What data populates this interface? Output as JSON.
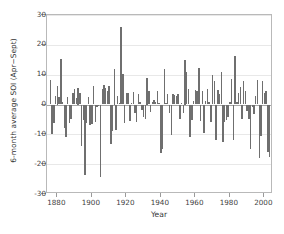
{
  "chart_data": {
    "type": "bar",
    "title": "",
    "subtitle": "",
    "xlabel": "Year",
    "ylabel": "6-month average SOI (Apr−Sept)",
    "xlim": [
      1874,
      2005
    ],
    "ylim": [
      -30,
      30
    ],
    "xticks": [
      1880,
      1900,
      1920,
      1940,
      1960,
      1980,
      2000
    ],
    "xtick_labels": [
      "1880",
      "1900",
      "1920",
      "1940",
      "1960",
      "1980",
      "2000"
    ],
    "yticks": [
      30,
      20,
      10,
      0,
      -10,
      -20,
      -30
    ],
    "ytick_labels": [
      "30",
      "20",
      "10",
      "0",
      "-10",
      "-20",
      "-30"
    ],
    "grid": true,
    "grid_axis": "y",
    "legend": "none",
    "bar_color": "#6f6f6f",
    "zero_line_color": "#a8a8a8",
    "frame_color": "#b9b9b9",
    "categories": [
      1876,
      1877,
      1878,
      1879,
      1880,
      1881,
      1882,
      1883,
      1884,
      1885,
      1886,
      1887,
      1888,
      1889,
      1890,
      1891,
      1892,
      1893,
      1894,
      1895,
      1896,
      1897,
      1898,
      1899,
      1900,
      1901,
      1902,
      1903,
      1904,
      1905,
      1906,
      1907,
      1908,
      1909,
      1910,
      1911,
      1912,
      1913,
      1914,
      1915,
      1916,
      1917,
      1918,
      1919,
      1920,
      1921,
      1922,
      1923,
      1924,
      1925,
      1926,
      1927,
      1928,
      1929,
      1930,
      1931,
      1932,
      1933,
      1934,
      1935,
      1936,
      1937,
      1938,
      1939,
      1940,
      1941,
      1942,
      1943,
      1944,
      1945,
      1946,
      1947,
      1948,
      1949,
      1950,
      1951,
      1952,
      1953,
      1954,
      1955,
      1956,
      1957,
      1958,
      1959,
      1960,
      1961,
      1962,
      1963,
      1964,
      1965,
      1966,
      1967,
      1968,
      1969,
      1970,
      1971,
      1972,
      1973,
      1974,
      1975,
      1976,
      1977,
      1978,
      1979,
      1980,
      1981,
      1982,
      1983,
      1984,
      1985,
      1986,
      1987,
      1988,
      1989,
      1990,
      1991,
      1992,
      1993,
      1994,
      1995,
      1996,
      1997,
      1998,
      1999,
      2000,
      2001,
      2002,
      2003
    ],
    "values": [
      8.1,
      -9.9,
      -6.3,
      3.0,
      6.2,
      2.5,
      15.3,
      1.0,
      -8.0,
      -10.9,
      2.4,
      -6.1,
      -4.9,
      3.9,
      5.2,
      2.2,
      5.7,
      4.0,
      -13.8,
      -5.2,
      -23.5,
      -6.3,
      2.6,
      -7.0,
      -6.7,
      6.1,
      -6.0,
      -1.0,
      -0.4,
      -24.2,
      5.1,
      6.4,
      5.6,
      4.5,
      6.3,
      -13.3,
      -8.9,
      11.9,
      -8.6,
      3.0,
      0.5,
      26.0,
      10.2,
      -6.3,
      4.0,
      3.8,
      -5.5,
      0.5,
      4.2,
      -3.0,
      -5.8,
      3.5,
      1.0,
      -2.0,
      -4.2,
      -4.7,
      8.8,
      4.6,
      -2.5,
      0.8,
      1.5,
      0.9,
      4.6,
      0.5,
      -16.2,
      -14.8,
      12.0,
      0.6,
      3.6,
      -2.9,
      -10.2,
      3.6,
      3.3,
      2.8,
      3.4,
      -5.0,
      0.5,
      -3.0,
      15.0,
      11.0,
      5.2,
      -11.0,
      -5.3,
      1.2,
      5.0,
      4.6,
      12.3,
      -5.6,
      4.6,
      -9.5,
      1.3,
      5.1,
      0.8,
      -6.0,
      9.9,
      8.0,
      -11.8,
      4.8,
      3.4,
      10.9,
      -12.5,
      -5.7,
      -5.3,
      -4.2,
      0.9,
      8.6,
      -11.8,
      16.3,
      1.0,
      4.0,
      6.0,
      -4.9,
      8.0,
      4.6,
      -2.3,
      -5.0,
      -15.0,
      -0.8,
      -3.2,
      2.7,
      8.3,
      -17.9,
      -10.5,
      8.0,
      4.0,
      4.5,
      -16.0,
      -17.5
    ]
  }
}
